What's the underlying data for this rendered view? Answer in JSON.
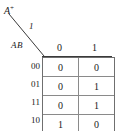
{
  "figure": {
    "type": "state-transition-table",
    "corner": {
      "output_label": "A",
      "output_superscript": "+",
      "input_label": "1",
      "state_label": "AB"
    },
    "columns": {
      "header": [
        "0",
        "1"
      ]
    },
    "rows": [
      {
        "label": "00",
        "values": [
          "0",
          "0"
        ]
      },
      {
        "label": "01",
        "values": [
          "0",
          "1"
        ]
      },
      {
        "label": "11",
        "values": [
          "0",
          "1"
        ]
      },
      {
        "label": "10",
        "values": [
          "1",
          "0"
        ]
      }
    ],
    "colors": {
      "ink": "#1a1a1a",
      "grid_line": "#8a8a8a",
      "frame_line": "#6f6f6f",
      "background": "#ffffff"
    }
  }
}
